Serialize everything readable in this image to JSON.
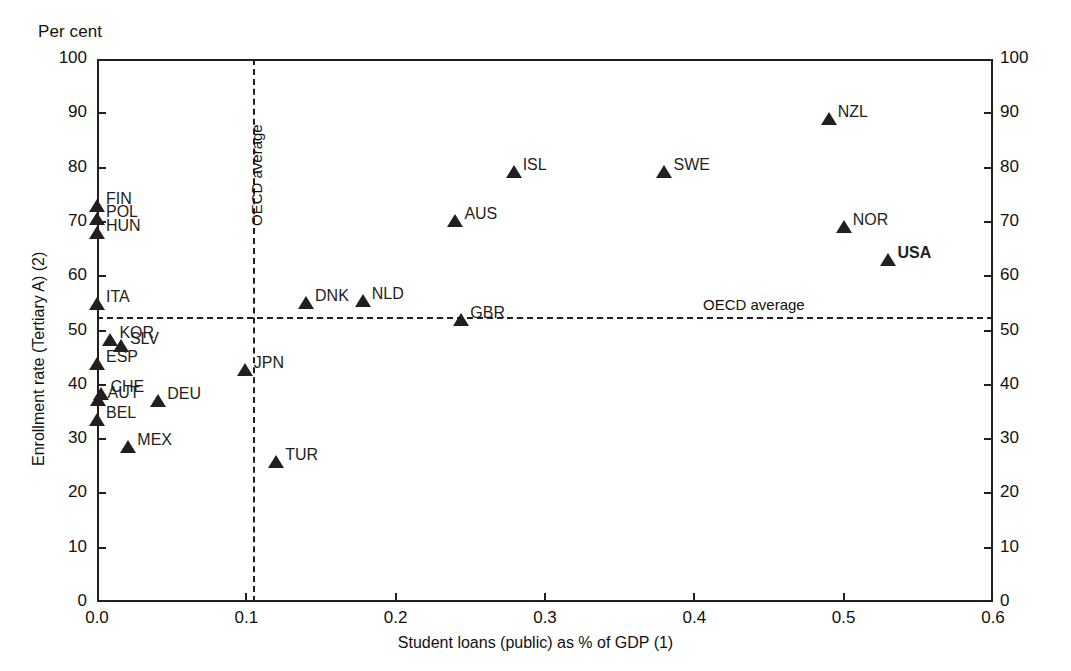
{
  "figure": {
    "unit_caption": "Per cent",
    "xaxis_title": "Student loans (public) as % of GDP (1)",
    "yaxis_title": "Enrollment rate (Tertiary A) (2)",
    "oecd_average_vertical_label": "OECD average",
    "oecd_average_horizontal_label": "OECD average",
    "marker_color": "#231f20",
    "axis_color": "#231f20",
    "background_color": "#ffffff"
  },
  "chart_data": {
    "type": "scatter",
    "title": "",
    "subtitle": "",
    "xlabel": "Student loans (public) as % of GDP (1)",
    "ylabel": "Enrollment rate (Tertiary A) (2)",
    "unit_label": "Per cent",
    "xlim": [
      0.0,
      0.6
    ],
    "ylim": [
      0,
      100
    ],
    "xticks": [
      0.0,
      0.1,
      0.2,
      0.3,
      0.4,
      0.5,
      0.6
    ],
    "xtick_labels": [
      "0.0",
      "0.1",
      "0.2",
      "0.3",
      "0.4",
      "0.5",
      "0.6"
    ],
    "yticks": [
      0,
      10,
      20,
      30,
      40,
      50,
      60,
      70,
      80,
      90,
      100
    ],
    "ytick_labels": [
      "0",
      "10",
      "20",
      "30",
      "40",
      "50",
      "60",
      "70",
      "80",
      "90",
      "100"
    ],
    "y_axis_both_sides": true,
    "grid": false,
    "legend": "none",
    "reference_lines": [
      {
        "orientation": "vertical",
        "value": 0.105,
        "label": "OECD average",
        "style": "dashed"
      },
      {
        "orientation": "horizontal",
        "value": 52.3,
        "label": "OECD average",
        "style": "dashed"
      }
    ],
    "points": [
      {
        "label": "FIN",
        "x": 0.0,
        "y": 73.0,
        "label_pos": "right",
        "bold": false
      },
      {
        "label": "POL",
        "x": 0.0,
        "y": 70.5,
        "label_pos": "right",
        "bold": false
      },
      {
        "label": "HUN",
        "x": 0.0,
        "y": 68.0,
        "label_pos": "right",
        "bold": false
      },
      {
        "label": "ITA",
        "x": 0.0,
        "y": 54.8,
        "label_pos": "right",
        "bold": false
      },
      {
        "label": "KOR",
        "x": 0.009,
        "y": 48.2,
        "label_pos": "right",
        "bold": false
      },
      {
        "label": "SLV",
        "x": 0.016,
        "y": 47.2,
        "label_pos": "right",
        "bold": false
      },
      {
        "label": "ESP",
        "x": 0.0,
        "y": 43.8,
        "label_pos": "right",
        "bold": false
      },
      {
        "label": "CHE",
        "x": 0.003,
        "y": 38.3,
        "label_pos": "right",
        "bold": false
      },
      {
        "label": "AUT",
        "x": 0.001,
        "y": 37.2,
        "label_pos": "right",
        "bold": false
      },
      {
        "label": "DEU",
        "x": 0.041,
        "y": 37.0,
        "label_pos": "right",
        "bold": false
      },
      {
        "label": "BEL",
        "x": 0.0,
        "y": 33.6,
        "label_pos": "right",
        "bold": false
      },
      {
        "label": "MEX",
        "x": 0.021,
        "y": 28.6,
        "label_pos": "right",
        "bold": false
      },
      {
        "label": "TUR",
        "x": 0.12,
        "y": 25.8,
        "label_pos": "right",
        "bold": false
      },
      {
        "label": "JPN",
        "x": 0.099,
        "y": 42.8,
        "label_pos": "right",
        "bold": false
      },
      {
        "label": "DNK",
        "x": 0.14,
        "y": 55.0,
        "label_pos": "right",
        "bold": false
      },
      {
        "label": "NLD",
        "x": 0.178,
        "y": 55.5,
        "label_pos": "right",
        "bold": false
      },
      {
        "label": "GBR",
        "x": 0.244,
        "y": 52.0,
        "label_pos": "right",
        "bold": false
      },
      {
        "label": "AUS",
        "x": 0.24,
        "y": 70.2,
        "label_pos": "right",
        "bold": false
      },
      {
        "label": "ISL",
        "x": 0.279,
        "y": 79.2,
        "label_pos": "right",
        "bold": false
      },
      {
        "label": "SWE",
        "x": 0.38,
        "y": 79.2,
        "label_pos": "right",
        "bold": false
      },
      {
        "label": "NZL",
        "x": 0.49,
        "y": 89.0,
        "label_pos": "right",
        "bold": false
      },
      {
        "label": "NOR",
        "x": 0.5,
        "y": 69.0,
        "label_pos": "right",
        "bold": false
      },
      {
        "label": "USA",
        "x": 0.53,
        "y": 63.0,
        "label_pos": "right",
        "bold": true
      }
    ]
  }
}
